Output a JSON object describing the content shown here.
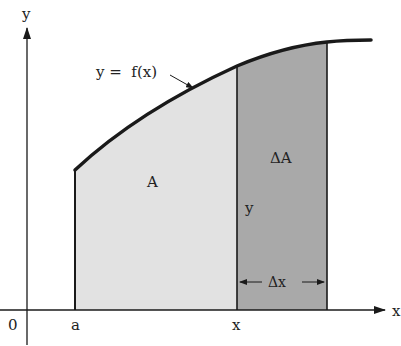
{
  "diagram": {
    "labels": {
      "y_axis": "y",
      "x_axis": "x",
      "origin": "0",
      "a": "a",
      "x_point": "x",
      "function": "y =  f(x)",
      "region_A": "A",
      "region_delta_A": "ΔA",
      "height_y": "y",
      "delta_x": "Δx"
    },
    "colors": {
      "region_A_fill": "#e2e2e2",
      "region_delta_A_fill": "#a9a9a9",
      "stroke": "#1a1a1a"
    }
  }
}
